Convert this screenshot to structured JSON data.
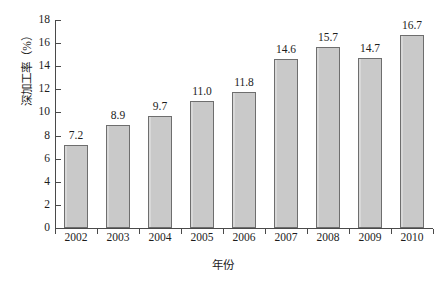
{
  "chart_data": {
    "type": "bar",
    "title": "",
    "subtitle": "",
    "xlabel": "年份",
    "ylabel": "深加工率（%）",
    "categories": [
      "2002",
      "2003",
      "2004",
      "2005",
      "2006",
      "2007",
      "2008",
      "2009",
      "2010"
    ],
    "values": [
      7.2,
      8.9,
      9.7,
      11.0,
      11.8,
      14.6,
      15.7,
      14.7,
      16.7
    ],
    "data_labels": [
      "7.2",
      "8.9",
      "9.7",
      "11.0",
      "11.8",
      "14.6",
      "15.7",
      "14.7",
      "16.7"
    ],
    "ylim": [
      0,
      18
    ],
    "ytick_step": 2,
    "ytick_labels": [
      "18",
      "16",
      "14",
      "12",
      "10",
      "8",
      "6",
      "4",
      "2",
      "0"
    ],
    "ytick_values": [
      18,
      16,
      14,
      12,
      10,
      8,
      6,
      4,
      2,
      0
    ],
    "grid": false,
    "legend": null,
    "legend_position": "none",
    "series": [
      {
        "name": "深加工率",
        "values": [
          7.2,
          8.9,
          9.7,
          11.0,
          11.8,
          14.6,
          15.7,
          14.7,
          16.7
        ],
        "color": "#c9c9c9",
        "border_color": "#6e6e6e"
      }
    ],
    "colors": {
      "bar_fill": "#c9c9c9",
      "bar_border": "#6e6e6e",
      "axis": "#4a4a4a",
      "text": "#1d1d1d",
      "background": "#ffffff"
    }
  }
}
